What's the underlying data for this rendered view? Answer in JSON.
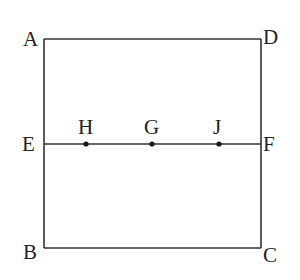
{
  "diagram": {
    "type": "geometry",
    "shape": "rectangle with horizontal midline",
    "colors": {
      "line": "#333333",
      "text": "#222222",
      "point": "#1a1a1a",
      "background": "#ffffff"
    },
    "vertices": {
      "A": {
        "label": "A",
        "x": 44,
        "y": 39
      },
      "D": {
        "label": "D",
        "x": 261,
        "y": 39
      },
      "B": {
        "label": "B",
        "x": 44,
        "y": 248
      },
      "C": {
        "label": "C",
        "x": 261,
        "y": 248
      },
      "E": {
        "label": "E",
        "x": 44,
        "y": 144
      },
      "F": {
        "label": "F",
        "x": 261,
        "y": 144
      }
    },
    "points_on_EF": {
      "H": {
        "label": "H",
        "x": 86,
        "y": 144
      },
      "G": {
        "label": "G",
        "x": 152,
        "y": 144
      },
      "J": {
        "label": "J",
        "x": 219,
        "y": 144
      }
    },
    "segments": [
      "AD",
      "DC",
      "CB",
      "BA",
      "EF"
    ]
  }
}
